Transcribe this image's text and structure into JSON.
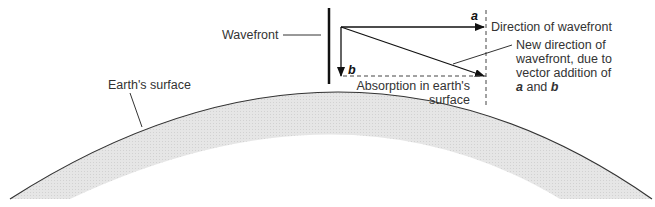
{
  "diagram": {
    "type": "vector-wavefront-absorption",
    "labels": {
      "wavefront": "Wavefront",
      "earth_surface": "Earth's surface",
      "direction": "Direction of wavefront",
      "new_direction_1": "New direction of",
      "new_direction_2": "wavefront, due to",
      "new_direction_3": "vector addition of",
      "new_direction_4_a": "a",
      "new_direction_4_and": " and ",
      "new_direction_4_b": "b",
      "absorption_1": "Absorption in earth's",
      "absorption_2": "surface",
      "vector_a": "a",
      "vector_b": "b"
    },
    "colors": {
      "line": "#222222",
      "earth_fill": "#e4e4e4",
      "text": "#333333"
    }
  }
}
